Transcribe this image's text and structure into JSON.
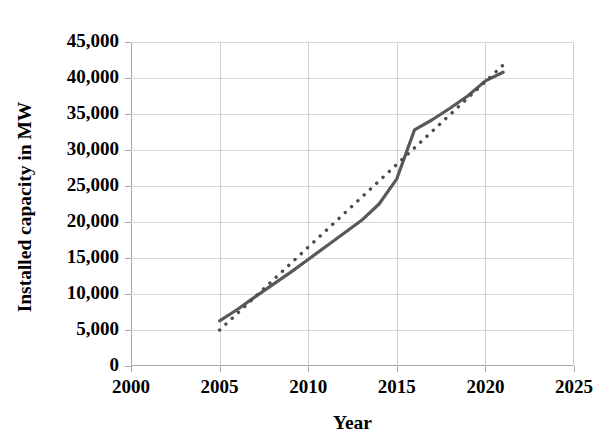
{
  "chart_data": {
    "type": "line",
    "title": "",
    "xlabel": "Year",
    "ylabel": "Installed capacity in MW",
    "xlim": [
      2000,
      2025
    ],
    "ylim": [
      0,
      45000
    ],
    "xticks": [
      "2000",
      "2005",
      "2010",
      "2015",
      "2020",
      "2025"
    ],
    "yticks": [
      "0",
      "5,000",
      "10,000",
      "15,000",
      "20,000",
      "25,000",
      "30,000",
      "35,000",
      "40,000",
      "45,000"
    ],
    "grid": true,
    "legend": "none",
    "series": [
      {
        "name": "Installed capacity",
        "style": "solid",
        "color": "#595959",
        "x": [
          2005,
          2006,
          2007,
          2008,
          2009,
          2010,
          2011,
          2012,
          2013,
          2014,
          2015,
          2016,
          2017,
          2018,
          2019,
          2020,
          2021
        ],
        "values": [
          6270,
          7850,
          9600,
          11300,
          13000,
          14800,
          16600,
          18400,
          20200,
          22500,
          26000,
          32800,
          34200,
          35800,
          37500,
          39600,
          40800
        ]
      },
      {
        "name": "Linear trend",
        "style": "dotted",
        "color": "#4d4d4d",
        "x": [
          2005,
          2021
        ],
        "values": [
          5000,
          41800
        ]
      }
    ],
    "axis_color": "#a6a6a6",
    "grid_color": "#d9d9d9",
    "text_color": "#000000",
    "title_remnant": ""
  },
  "geometry": {
    "plot_left": 131,
    "plot_top": 42,
    "plot_width": 443,
    "plot_height": 324
  }
}
